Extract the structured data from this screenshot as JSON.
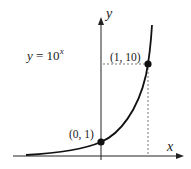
{
  "diagram": {
    "equation": {
      "base": "y  =  10",
      "exponent": "x"
    },
    "axes": {
      "x_label": "x",
      "y_label": "y"
    },
    "points": [
      {
        "label": "(0, 1)",
        "x": 0,
        "y": 1
      },
      {
        "label": "(1, 10)",
        "x": 1,
        "y": 10
      }
    ],
    "colors": {
      "ink": "#222222",
      "dash": "#555555"
    }
  },
  "chart_data": {
    "type": "line",
    "xlabel": "x",
    "ylabel": "y",
    "series": [
      {
        "name": "y = 10^x",
        "x": [
          -2,
          -1,
          -0.5,
          0,
          0.5,
          1,
          1.05
        ],
        "values": [
          0.01,
          0.1,
          0.316,
          1,
          3.16,
          10,
          11.2
        ]
      }
    ],
    "annotations": [
      "(0, 1)",
      "(1, 10)"
    ],
    "grid": false
  }
}
